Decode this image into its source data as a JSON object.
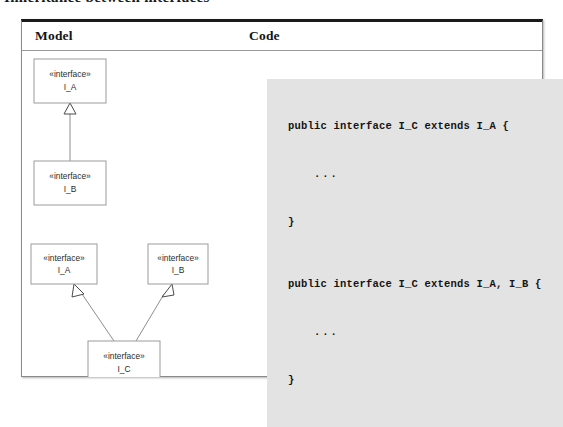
{
  "caption": {
    "text": "Inheritance between interfaces"
  },
  "table": {
    "headers": {
      "model": "Model",
      "code": "Code"
    }
  },
  "diagrams": [
    {
      "id": "single-inheritance",
      "boxes": [
        {
          "id": "box-i-a-top",
          "stereotype": "«interface»",
          "name": "I_A",
          "x": 12,
          "y": 8,
          "w": 72,
          "h": 44
        },
        {
          "id": "box-i-b-top",
          "stereotype": "«interface»",
          "name": "I_B",
          "x": 12,
          "y": 110,
          "w": 72,
          "h": 44
        }
      ],
      "relationship": "generalization"
    },
    {
      "id": "multiple-inheritance",
      "boxes": [
        {
          "id": "box-i-a-bottom",
          "stereotype": "«interface»",
          "name": "I_A",
          "x": 9,
          "y": 193,
          "w": 66,
          "h": 40
        },
        {
          "id": "box-i-b-bottom",
          "stereotype": "«interface»",
          "name": "I_B",
          "x": 126,
          "y": 193,
          "w": 60,
          "h": 40
        },
        {
          "id": "box-i-c-bottom",
          "stereotype": "«interface»",
          "name": "I_C",
          "x": 66,
          "y": 290,
          "w": 72,
          "h": 44
        }
      ],
      "relationship": "generalization"
    }
  ],
  "code_samples": [
    {
      "id": "code-single",
      "lines": [
        "public interface I_C extends I_A {",
        "...",
        "}"
      ]
    },
    {
      "id": "code-multiple",
      "lines": [
        "public interface I_C extends I_A, I_B {",
        "...",
        "}"
      ]
    }
  ],
  "colors": {
    "frame_top": "#1a1a1a",
    "frame_border": "#8a8a8a",
    "code_background": "#e3e3e3",
    "box_stroke": "#9b9b9b",
    "link_stroke": "#8e8e8e"
  }
}
